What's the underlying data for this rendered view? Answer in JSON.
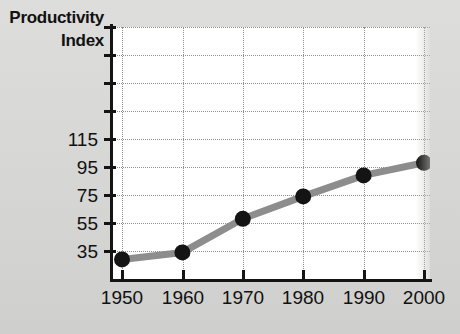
{
  "chart_data": {
    "type": "line",
    "title": "",
    "axis_title_lines": [
      "Productivity",
      "Index"
    ],
    "xlabel": "",
    "ylabel": "Productivity Index",
    "x": [
      1950,
      1960,
      1970,
      1980,
      1990,
      2000
    ],
    "xticklabels": [
      "1950",
      "1960",
      "1970",
      "1980",
      "1990",
      "2000"
    ],
    "values": [
      39,
      44,
      68,
      84,
      99,
      108
    ],
    "series": [
      {
        "name": "Productivity Index",
        "values": [
          39,
          44,
          68,
          84,
          99,
          108
        ]
      }
    ],
    "yticks": [
      35,
      55,
      75,
      95,
      115,
      135,
      155,
      175,
      195
    ],
    "yticklabels": [
      "35",
      "95",
      "75",
      "95",
      "115",
      "",
      "",
      "",
      ""
    ],
    "ytick_labeled": [
      "35",
      "55",
      "75",
      "95",
      "115"
    ],
    "ylim": [
      25,
      205
    ],
    "xlim": [
      1948,
      2002
    ],
    "grid": true,
    "legend": false,
    "legend_position": "none",
    "marker": "circle",
    "line_color": "#8d8d8d",
    "marker_color": "#141414",
    "grid_color": "#8f8f8f",
    "background_color": "#ffffff",
    "page_background_color": "#d7d7d5",
    "text_color": "#111111"
  },
  "axis": {
    "title": {
      "line1": "Productivity",
      "line2": "Index"
    },
    "y_labels": [
      "115",
      "95",
      "75",
      "55",
      "35"
    ],
    "x_labels": [
      "1950",
      "1960",
      "1970",
      "1980",
      "1990",
      "2000"
    ]
  }
}
